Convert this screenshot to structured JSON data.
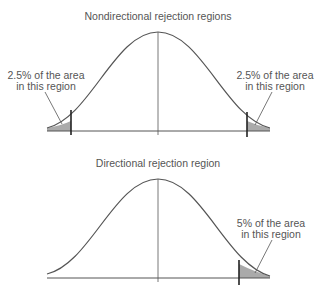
{
  "top_panel": {
    "title": "Nondirectional rejection regions",
    "left_label": [
      "2.5% of the area",
      "in this region"
    ],
    "right_label": [
      "2.5% of the area",
      "in this region"
    ]
  },
  "bottom_panel": {
    "title": "Directional rejection region",
    "right_label": [
      "5% of the area",
      "in this region"
    ]
  },
  "colors": {
    "curve": "#555555",
    "shade": "#aaaaaa",
    "text": "#555555"
  }
}
